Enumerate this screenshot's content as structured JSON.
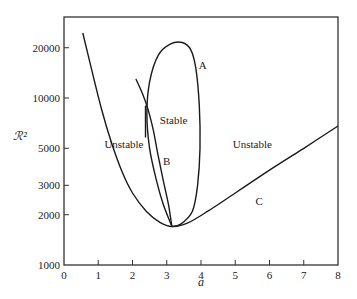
{
  "chart_data": {
    "type": "line",
    "title": "",
    "xlabel": "a",
    "ylabel": "ℛ²",
    "xlim": [
      0,
      8
    ],
    "ylim": [
      1000,
      25000
    ],
    "yscale": "log",
    "grid": false,
    "legend": null,
    "xticks": [
      0,
      1,
      2,
      3,
      4,
      5,
      6,
      7,
      8
    ],
    "xtick_labels": [
      "0",
      "1",
      "2",
      "3",
      "4",
      "5",
      "6",
      "7",
      "8"
    ],
    "yticks": [
      1000,
      2000,
      3000,
      5000,
      10000,
      20000
    ],
    "ytick_labels": [
      "1000",
      "2000",
      "3000",
      "5000",
      "10000",
      "20000"
    ],
    "series": [
      {
        "name": "C",
        "points": [
          [
            0.55,
            24500
          ],
          [
            0.8,
            15000
          ],
          [
            1.1,
            8500
          ],
          [
            1.4,
            5300
          ],
          [
            1.7,
            3600
          ],
          [
            2.0,
            2700
          ],
          [
            2.4,
            2100
          ],
          [
            2.8,
            1800
          ],
          [
            3.15,
            1700
          ],
          [
            3.6,
            1780
          ],
          [
            4.2,
            2100
          ],
          [
            5.0,
            2700
          ],
          [
            6.0,
            3700
          ],
          [
            7.0,
            5000
          ],
          [
            8.0,
            6800
          ]
        ]
      },
      {
        "name": "A",
        "points": [
          [
            3.15,
            1700
          ],
          [
            2.9,
            2300
          ],
          [
            2.7,
            3200
          ],
          [
            2.5,
            5000
          ],
          [
            2.42,
            8000
          ],
          [
            2.5,
            12500
          ],
          [
            2.75,
            18000
          ],
          [
            3.1,
            21000
          ],
          [
            3.45,
            21500
          ],
          [
            3.7,
            19500
          ],
          [
            3.85,
            15000
          ],
          [
            3.95,
            9000
          ],
          [
            3.97,
            5000
          ],
          [
            3.9,
            3000
          ],
          [
            3.75,
            2100
          ],
          [
            3.4,
            1750
          ],
          [
            3.15,
            1700
          ]
        ]
      },
      {
        "name": "B",
        "points": [
          [
            2.1,
            13000
          ],
          [
            2.3,
            10500
          ],
          [
            2.45,
            8600
          ],
          [
            2.6,
            6500
          ],
          [
            2.75,
            4500
          ],
          [
            2.9,
            3200
          ],
          [
            3.05,
            2300
          ],
          [
            3.15,
            1700
          ]
        ]
      },
      {
        "name": "B-stub",
        "points": [
          [
            2.38,
            9000
          ],
          [
            2.38,
            5800
          ]
        ]
      }
    ],
    "annotations": [
      {
        "text": "A",
        "x": 4.05,
        "y": 15000,
        "kind": "curve"
      },
      {
        "text": "B",
        "x": 3.0,
        "y": 3950,
        "kind": "curve"
      },
      {
        "text": "C",
        "x": 5.7,
        "y": 2300,
        "kind": "curve"
      },
      {
        "text": "Stable",
        "x": 3.2,
        "y": 7000,
        "kind": "region"
      },
      {
        "text": "Unstable",
        "x": 1.75,
        "y": 5000,
        "kind": "region"
      },
      {
        "text": "Unstable",
        "x": 5.5,
        "y": 5000,
        "kind": "region"
      }
    ],
    "colors": {
      "line": "#1a1a1a",
      "axis": "#333333",
      "text": "#222222"
    }
  }
}
